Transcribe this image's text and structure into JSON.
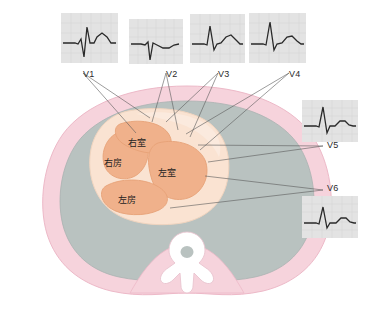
{
  "figure": {
    "title": "",
    "type": "anatomical-diagram"
  },
  "colors": {
    "body_wall": "#f6d3dc",
    "body_wall_edge": "#edb9c8",
    "lung": "#b9c2c0",
    "lung_edge": "#a9b3b1",
    "heart_outer": "#fae3d2",
    "heart_chamber": "#f0b18b",
    "heart_chamber_edge": "#e7a177",
    "heart_light": "#fbe9dc",
    "spine": "#ffffff",
    "spine_edge": "#e9c4cf",
    "leader_line": "#5a5a5a",
    "ecg_grid_bg": "#e3e3e3",
    "ecg_grid_line": "#d2d2d2",
    "ecg_trace": "#2a2a2a",
    "label_text": "#2b2b2b"
  },
  "chambers": [
    {
      "id": "right-ventricle",
      "label": "右室",
      "x": 128,
      "y": 139
    },
    {
      "id": "right-atrium",
      "label": "右房",
      "x": 104,
      "y": 159
    },
    {
      "id": "left-ventricle",
      "label": "左室",
      "x": 158,
      "y": 169
    },
    {
      "id": "left-atrium",
      "label": "左房",
      "x": 118,
      "y": 196
    }
  ],
  "leads": [
    {
      "id": "V1",
      "label": "V1",
      "label_x": 83,
      "label_y": 70,
      "panel": {
        "x": 61,
        "y": 13,
        "w": 57,
        "h": 50
      },
      "morphology": "small r wave, deep S wave, upright T wave",
      "trace": "M2,30 L14,30 L17,31 L20,26 L23,44 L26,14 L29,30 L33,30 L36,24 L41,20 L46,24 L50,30 L55,30",
      "leader_targets": [
        [
          136,
          133
        ],
        [
          150,
          118
        ]
      ]
    },
    {
      "id": "V2",
      "label": "V2",
      "label_x": 166,
      "label_y": 70,
      "panel": {
        "x": 129,
        "y": 19,
        "w": 54,
        "h": 45
      },
      "morphology": "deep narrow S wave, shallow broad T wave",
      "trace": "M2,25 L12,25 L16,26 L19,23 L21,41 L24,24 L28,26 L34,29 L40,29 L45,26 L50,25",
      "leader_targets": [
        [
          152,
          122
        ],
        [
          178,
          130
        ]
      ]
    },
    {
      "id": "V3",
      "label": "V3",
      "label_x": 218,
      "label_y": 70,
      "panel": {
        "x": 190,
        "y": 14,
        "w": 55,
        "h": 49
      },
      "morphology": "transitional R wave with upright T wave",
      "trace": "M2,30 L14,30 L17,31 L20,12 L24,36 L27,30 L31,29 L36,23 L41,21 L46,26 L50,30 L53,30",
      "leader_targets": [
        [
          166,
          122
        ],
        [
          190,
          137
        ]
      ]
    },
    {
      "id": "V4",
      "label": "V4",
      "label_x": 289,
      "label_y": 70,
      "panel": {
        "x": 249,
        "y": 13,
        "w": 57,
        "h": 50
      },
      "morphology": "tall R wave, small S wave, upright T wave",
      "trace": "M2,31 L14,31 L17,32 L21,9 L25,37 L28,31 L33,30 L38,24 L43,23 L48,28 L52,31 L55,31",
      "leader_targets": [
        [
          186,
          134
        ],
        [
          200,
          150
        ]
      ]
    },
    {
      "id": "V5",
      "label": "V5",
      "label_x": 327,
      "label_y": 148,
      "panel": {
        "x": 302,
        "y": 100,
        "w": 56,
        "h": 42
      },
      "morphology": "tall R wave, upright T wave",
      "trace": "M2,26 L14,26 L17,27 L21,7 L25,33 L28,26 L33,26 L38,21 L43,21 L47,25 L51,26 L54,26",
      "leader_targets": [
        [
          198,
          145
        ],
        [
          208,
          162
        ]
      ]
    },
    {
      "id": "V6",
      "label": "V6",
      "label_x": 327,
      "label_y": 186,
      "panel": {
        "x": 302,
        "y": 196,
        "w": 56,
        "h": 42
      },
      "morphology": "tall R wave, lower amplitude, upright T wave",
      "trace": "M2,27 L14,27 L17,28 L21,11 L25,32 L28,27 L34,27 L39,22 L44,22 L48,26 L52,27 L54,27",
      "leader_targets": [
        [
          205,
          176
        ],
        [
          170,
          208
        ]
      ]
    }
  ]
}
